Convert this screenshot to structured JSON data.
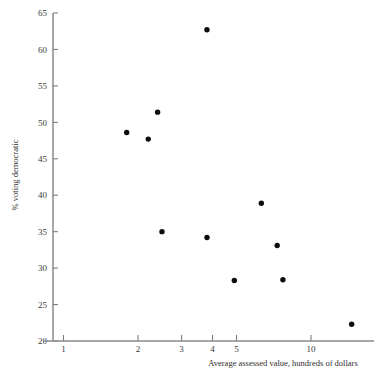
{
  "chart_data": {
    "type": "scatter",
    "title": "",
    "xlabel": "Average assessed value, hundreds of dollars",
    "ylabel": "% voting democratic",
    "xscale": "log",
    "yscale": "linear",
    "xlim": [
      0.85,
      16.5
    ],
    "ylim": [
      20,
      65
    ],
    "grid": false,
    "legend": null,
    "xticks": [
      1,
      2,
      3,
      4,
      5,
      10
    ],
    "xtick_labels": [
      "1",
      "2",
      "3",
      "4",
      "5",
      "10"
    ],
    "yticks": [
      20,
      25,
      30,
      35,
      40,
      45,
      50,
      55,
      60,
      65
    ],
    "ytick_labels": [
      "20",
      "25",
      "30",
      "35",
      "40",
      "45",
      "50",
      "55",
      "60",
      "65"
    ],
    "marker": "filled-circle",
    "marker_color": "#0d0d0d",
    "points": [
      {
        "x": 1.8,
        "y": 48.6
      },
      {
        "x": 2.2,
        "y": 47.7
      },
      {
        "x": 2.4,
        "y": 51.4
      },
      {
        "x": 2.5,
        "y": 35.0
      },
      {
        "x": 3.8,
        "y": 62.7
      },
      {
        "x": 3.8,
        "y": 34.2
      },
      {
        "x": 4.9,
        "y": 28.3
      },
      {
        "x": 6.3,
        "y": 38.9
      },
      {
        "x": 7.3,
        "y": 33.1
      },
      {
        "x": 7.7,
        "y": 28.4
      },
      {
        "x": 14.6,
        "y": 22.3
      }
    ],
    "series": [
      {
        "name": "wards",
        "x": [
          1.8,
          2.2,
          2.4,
          2.5,
          3.8,
          3.8,
          4.9,
          6.3,
          7.3,
          7.7,
          14.6
        ],
        "values": [
          48.6,
          47.7,
          51.4,
          35.0,
          62.7,
          34.2,
          28.3,
          38.9,
          33.1,
          28.4,
          22.3
        ]
      }
    ]
  },
  "colors": {
    "background": "#ffffff",
    "axis": "#8a8a8a",
    "tick": "#7d7d7d",
    "text": "#3a3a3a",
    "marker": "#0d0d0d"
  }
}
